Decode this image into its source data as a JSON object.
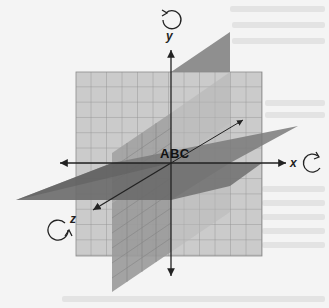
{
  "figure": {
    "center_label": "ABC",
    "axes": [
      {
        "name": "x",
        "label": "x",
        "rotation": "clockwise"
      },
      {
        "name": "y",
        "label": "y",
        "rotation": "counterclockwise"
      },
      {
        "name": "z",
        "label": "z",
        "rotation": "clockwise"
      }
    ],
    "planes": [
      "xy-plane (grid)",
      "xz-plane (horizontal)",
      "yz-plane (vertical)"
    ],
    "colors": {
      "grid_fill": "#c8c8c8",
      "grid_line": "#8a8a8a",
      "horizontal_plane": "#6e6e6e",
      "vertical_plane": "#9a9a9a",
      "axis": "#222222",
      "background": "#f4f4f4"
    }
  }
}
